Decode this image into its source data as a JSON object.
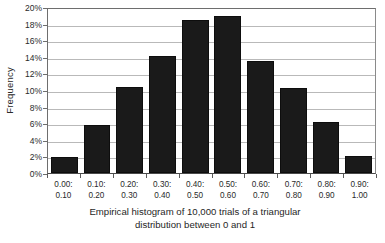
{
  "chart_data": {
    "type": "bar",
    "title": "",
    "xlabel": "Empirical histogram of 10,000 trials of a triangular distribution between 0 and 1",
    "ylabel": "Frequency",
    "ylim": [
      0,
      20
    ],
    "grid": true,
    "legend": false,
    "categories": [
      "0.00: 0.10",
      "0.10: 0.20",
      "0.20: 0.30",
      "0.30: 0.40",
      "0.40: 0.50",
      "0.50: 0.60",
      "0.60: 0.70",
      "0.70: 0.80",
      "0.80: 0.90",
      "0.90: 1.00"
    ],
    "category_lines": [
      [
        "0.00:",
        "0.10"
      ],
      [
        "0.10:",
        "0.20"
      ],
      [
        "0.20:",
        "0.30"
      ],
      [
        "0.30:",
        "0.40"
      ],
      [
        "0.40:",
        "0.50"
      ],
      [
        "0.50:",
        "0.60"
      ],
      [
        "0.60:",
        "0.70"
      ],
      [
        "0.70:",
        "0.80"
      ],
      [
        "0.80:",
        "0.90"
      ],
      [
        "0.90:",
        "1.00"
      ]
    ],
    "values": [
      1.9,
      5.8,
      10.4,
      14.1,
      18.4,
      18.9,
      13.5,
      10.2,
      6.2,
      2.1
    ],
    "value_unit": "%",
    "ytick_values": [
      20,
      18,
      16,
      14,
      12,
      10,
      8,
      6,
      4,
      2,
      0
    ],
    "ytick_labels": [
      "20%",
      "18%",
      "16%",
      "14%",
      "12%",
      "10%",
      "8%",
      "6%",
      "4%",
      "2%",
      "0%"
    ],
    "bar_color": "#1a1a1a",
    "gridline_color": "#b9b9b9",
    "axis_color": "#6e6e6e",
    "background_color": "#ffffff"
  },
  "caption": {
    "line1": "Empirical histogram of 10,000 trials of a triangular",
    "line2": "distribution between 0 and 1"
  },
  "axes": {
    "y_title": "Frequency"
  }
}
